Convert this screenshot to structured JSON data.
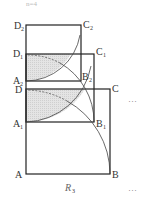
{
  "figure": {
    "top_caption": "n=4",
    "caption": "R",
    "caption_sub": "3",
    "ellipsis": "···",
    "squares": [
      {
        "name": "ABCD",
        "labels": {
          "A": [
            "A",
            ""
          ],
          "B": [
            "B",
            ""
          ],
          "C": [
            "C",
            ""
          ],
          "D": [
            "D",
            ""
          ]
        }
      },
      {
        "name": "A1B1C1D1",
        "labels": {
          "A": [
            "A",
            "1"
          ],
          "B": [
            "B",
            "1"
          ],
          "C": [
            "C",
            "1"
          ],
          "D": [
            "D",
            "1"
          ]
        }
      },
      {
        "name": "A2B2C2D2",
        "labels": {
          "A": [
            "A",
            "2"
          ],
          "B": [
            "B",
            "2"
          ],
          "C": [
            "C",
            "2"
          ],
          "D": [
            "D",
            "2"
          ]
        }
      }
    ],
    "colors": {
      "stroke": "#222222",
      "shade": "#d9d9d9",
      "arc": "#444444"
    }
  }
}
